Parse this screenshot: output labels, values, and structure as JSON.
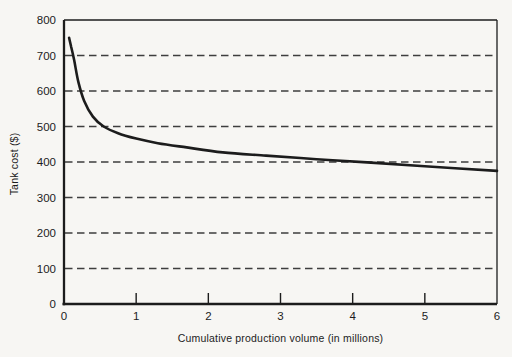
{
  "figure": {
    "background": "#f7f6f3"
  },
  "chart_data": {
    "type": "line",
    "title": "",
    "xlabel": "Cumulative production volume (in millions)",
    "ylabel": "Tank cost ($)",
    "xlim": [
      0,
      6
    ],
    "ylim": [
      0,
      800
    ],
    "x_ticks": [
      0,
      1,
      2,
      3,
      4,
      5,
      6
    ],
    "y_ticks": [
      0,
      100,
      200,
      300,
      400,
      500,
      600,
      700,
      800
    ],
    "grid": "horizontal-dashed",
    "legend": "none",
    "series": [
      {
        "name": "tank-cost-learning-curve",
        "color": "#1c1c1c",
        "points": [
          [
            0.07,
            750
          ],
          [
            0.1,
            724
          ],
          [
            0.14,
            688
          ],
          [
            0.2,
            625
          ],
          [
            0.28,
            572
          ],
          [
            0.4,
            528
          ],
          [
            0.55,
            500
          ],
          [
            0.75,
            481
          ],
          [
            1.0,
            466
          ],
          [
            1.3,
            453
          ],
          [
            1.7,
            441
          ],
          [
            2.2,
            427
          ],
          [
            2.8,
            418
          ],
          [
            3.5,
            408
          ],
          [
            4.2,
            399
          ],
          [
            5.0,
            388
          ],
          [
            6.0,
            375
          ]
        ]
      }
    ],
    "colors": {
      "axis": "#1c1c1c",
      "grid": "#3e3e3e",
      "text": "#1c1c1c"
    }
  }
}
